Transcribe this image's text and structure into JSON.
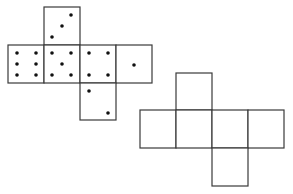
{
  "diagram": {
    "type": "cube-nets",
    "nets": [
      {
        "name": "dotted-net",
        "faces": [
          {
            "position": "top",
            "x": 44,
            "y": 7,
            "pips": 3
          },
          {
            "position": "row-1",
            "x": 8,
            "y": 45,
            "pips": 6
          },
          {
            "position": "row-2",
            "x": 44,
            "y": 45,
            "pips": 5
          },
          {
            "position": "row-3",
            "x": 80,
            "y": 45,
            "pips": 4
          },
          {
            "position": "row-4",
            "x": 116,
            "y": 45,
            "pips": 1
          },
          {
            "position": "bottom",
            "x": 80,
            "y": 83,
            "pips": 2
          }
        ]
      },
      {
        "name": "blank-net",
        "faces": [
          {
            "position": "top",
            "x": 176,
            "y": 73
          },
          {
            "position": "row-1",
            "x": 140,
            "y": 110
          },
          {
            "position": "row-2",
            "x": 176,
            "y": 110
          },
          {
            "position": "row-3",
            "x": 212,
            "y": 110
          },
          {
            "position": "row-4",
            "x": 248,
            "y": 110
          },
          {
            "position": "bottom",
            "x": 212,
            "y": 148
          }
        ]
      }
    ]
  }
}
